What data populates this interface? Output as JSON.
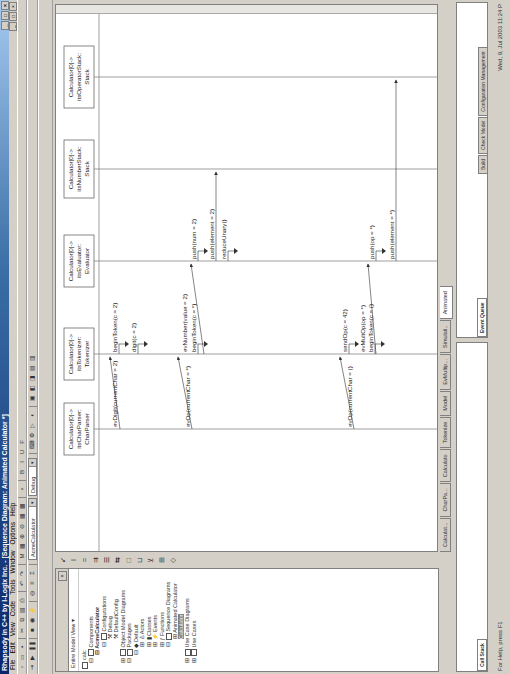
{
  "window": {
    "title": "Rhapsody in C++ by I-Logix Inc. - [Sequence Diagram: Animated Calculator *]",
    "controls": [
      "_",
      "□",
      "×"
    ]
  },
  "menu": [
    "File",
    "Edit",
    "View",
    "Code",
    "Tools",
    "Window",
    "Options",
    "Help"
  ],
  "toolbar": {
    "component_combo": "AcmeCalculator",
    "config_combo": "Debug"
  },
  "browser": {
    "title": "",
    "view_selector": "Entire Model View",
    "tree": [
      {
        "label": "calc",
        "level": 0
      },
      {
        "label": "Components",
        "level": 1
      },
      {
        "label": "AcmeCalculator",
        "level": 2,
        "bold": true
      },
      {
        "label": "Configurations",
        "level": 3
      },
      {
        "label": "Debug",
        "level": 4
      },
      {
        "label": "DefaultConfig",
        "level": 4
      },
      {
        "label": "Object Model Diagrams",
        "level": 1
      },
      {
        "label": "Packages",
        "level": 1
      },
      {
        "label": "Default",
        "level": 2
      },
      {
        "label": "Actors",
        "level": 3
      },
      {
        "label": "Classes",
        "level": 3
      },
      {
        "label": "Events",
        "level": 3
      },
      {
        "label": "Functions",
        "level": 3
      },
      {
        "label": "Sequence Diagrams",
        "level": 3
      },
      {
        "label": "Animated Calculator",
        "level": 4
      },
      {
        "label": "Calculator",
        "level": 4,
        "selected": true
      },
      {
        "label": "Use Case Diagrams",
        "level": 1
      },
      {
        "label": "Use Cases",
        "level": 1
      }
    ]
  },
  "diagram_toolbar": [
    "↙",
    "I",
    "=",
    "⇉",
    "☰",
    "⇆",
    "□",
    "⊔",
    "⊻",
    "⊞",
    "◇"
  ],
  "sequence_diagram": {
    "lifelines": [
      {
        "line1": "Calculator[0]->",
        "line2": "itsCharParser:",
        "line3": "CharParser"
      },
      {
        "line1": "Calculator[0]->",
        "line2": "itsTokenizer:",
        "line3": "Tokenizer"
      },
      {
        "line1": "Calculator[0]->",
        "line2": "itsEvaluator:",
        "line3": "Evaluator"
      },
      {
        "line1": "Calculator[0]->",
        "line2": "itsNumberStack:",
        "line3": "Stack"
      },
      {
        "line1": "Calculator[0]->",
        "line2": "itsOperatorStack:",
        "line3": "Stack"
      }
    ],
    "messages": [
      {
        "label": "evDigit(currentChar = 2)"
      },
      {
        "label": "beginToken(c = 2)"
      },
      {
        "label": "digit(c = 2)"
      },
      {
        "label": "evOp(currentChar = *)"
      },
      {
        "label": "evNumber(value = 2)"
      },
      {
        "label": "beginToken(c = *)"
      },
      {
        "label": "push(num = 2)"
      },
      {
        "label": "push(element = 2)"
      },
      {
        "label": "reduceUnary()"
      },
      {
        "label": "evOp(currentChar = ()"
      },
      {
        "label": "sendOp(c = 42)"
      },
      {
        "label": "evMultOp(op = *)"
      },
      {
        "label": "beginToken(c = ()"
      },
      {
        "label": "push(op = *)"
      },
      {
        "label": "push(element = *)"
      }
    ]
  },
  "document_tabs": [
    {
      "label": "Calculat..."
    },
    {
      "label": "CharPa..."
    },
    {
      "label": "Calculato"
    },
    {
      "label": "Tokenize"
    },
    {
      "label": "Model"
    },
    {
      "label": "EvMultip..."
    },
    {
      "label": "Simulati.."
    },
    {
      "label": "Animated",
      "active": true
    }
  ],
  "output_left": {
    "tabs": [
      {
        "label": "Call Stack",
        "active": true
      }
    ]
  },
  "output_right": {
    "tabs": [
      {
        "label": "Event Queue",
        "active": true
      }
    ]
  },
  "output_bottom_tabs": [
    {
      "label": "Build"
    },
    {
      "label": "Check Model"
    },
    {
      "label": "Configuration Management"
    }
  ],
  "status": {
    "help": "For Help, press F1",
    "datetime": "Wed, 9, Jul 2003  11:24 P"
  }
}
